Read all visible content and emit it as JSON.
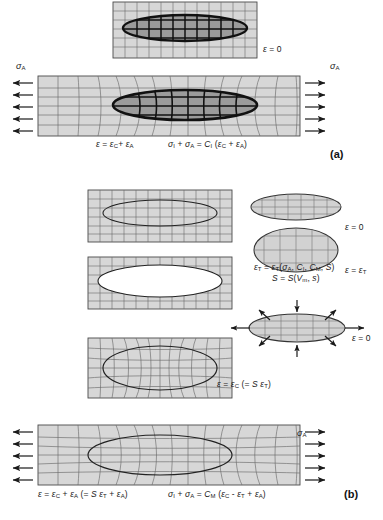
{
  "figure": {
    "panels": [
      {
        "id": "a",
        "tag": "(a)",
        "tag_x": 330,
        "tag_y": 152
      },
      {
        "id": "b",
        "tag": "(b)",
        "tag_y": 492,
        "tag_x": 344
      }
    ]
  },
  "colors": {
    "grid_fill": "#d7d7d7",
    "grid_line": "#4a4a4a",
    "inclusion_dark": "#9b9b9b",
    "inclusion_outline": "#111111",
    "inclusion_white": "#ffffff",
    "arrow": "#1a1a1a",
    "text": "#1a1a1a"
  },
  "labels": {
    "a_top_strain": "ε = 0",
    "a_bottom_strain": "ε = εC+ εA",
    "a_bottom_stress": "σI + σA = CI (εC + εA)",
    "sigma_a": "σA",
    "b_free_strain_zero": "ε = 0",
    "b_free_strain_t": "ε = εT",
    "b_eq_epsT": "εT = εT(σA, CI, CM, S)",
    "b_eq_S": "S = S(Vm, s)",
    "b_constrained_strain": "ε = εC (= S εT)",
    "b_hole_strain_zero": "ε = 0",
    "b_bottom_strain": "ε = εC + εA (= S εT + εA)",
    "b_bottom_stress": "σI + σA = CM (εC - εT + εA)"
  },
  "label_parts": {
    "eps": "ε",
    "sigma": "σ",
    "equals": "=",
    "plus": "+",
    "minus": "-",
    "zero": "0",
    "S": "S",
    "C": "C",
    "V": "V",
    "s_small": "s",
    "sub_A": "A",
    "sub_C": "C",
    "sub_T": "T",
    "sub_I": "I",
    "sub_M": "M",
    "sub_m": "m"
  },
  "diagrams": {
    "a_top": {
      "name": "undeformed-matrix-with-inclusion",
      "strain": "ε = 0",
      "inclusion_fill": "dark",
      "grid_deformed": false,
      "arrows": false
    },
    "a_bottom": {
      "name": "loaded-matrix-with-inclusion",
      "inclusion_fill": "dark",
      "grid_deformed": true,
      "arrows": true,
      "arrow_count_per_side": 5
    },
    "b_1": {
      "name": "matrix-with-inclusion-outline",
      "inclusion_fill": "none",
      "grid_deformed": false,
      "arrows": false
    },
    "b_2": {
      "name": "matrix-with-hole",
      "inclusion_fill": "white",
      "grid_deformed": false,
      "arrows": false
    },
    "b_3": {
      "name": "matrix-with-constrained-inclusion",
      "inclusion_fill": "none",
      "grid_deformed": true,
      "arrows": false
    },
    "b_4": {
      "name": "loaded-matrix-with-constrained-inclusion",
      "inclusion_fill": "none",
      "grid_deformed": true,
      "arrows": true,
      "arrow_count_per_side": 5
    },
    "b_free_flat": {
      "name": "free-inclusion-unstrained",
      "shape": "flat-ellipse",
      "strain": "ε = 0"
    },
    "b_free_round": {
      "name": "free-inclusion-transformed",
      "shape": "round-ellipse",
      "strain": "ε = εT"
    },
    "b_traction": {
      "name": "inclusion-with-surface-tractions",
      "strain": "ε = 0",
      "arrow_directions": [
        "left-out",
        "right-out",
        "top-in",
        "bottom-in",
        "diagonal-out"
      ]
    }
  }
}
